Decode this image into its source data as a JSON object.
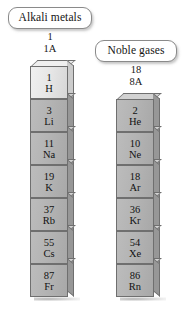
{
  "labels": {
    "alkali": "Alkali metals",
    "noble": "Noble gases"
  },
  "groups": {
    "left": {
      "number": "1",
      "roman": "1A"
    },
    "right": {
      "number": "18",
      "roman": "8A"
    }
  },
  "columns": [
    {
      "id": "alkali-metals-column",
      "label": "Alkali metals",
      "group_number": "1",
      "group_roman": "1A",
      "elements": [
        {
          "atomic_number": "1",
          "symbol": "H",
          "highlight": true
        },
        {
          "atomic_number": "3",
          "symbol": "Li",
          "highlight": false
        },
        {
          "atomic_number": "11",
          "symbol": "Na",
          "highlight": false
        },
        {
          "atomic_number": "19",
          "symbol": "K",
          "highlight": false
        },
        {
          "atomic_number": "37",
          "symbol": "Rb",
          "highlight": false
        },
        {
          "atomic_number": "55",
          "symbol": "Cs",
          "highlight": false
        },
        {
          "atomic_number": "87",
          "symbol": "Fr",
          "highlight": false
        }
      ]
    },
    {
      "id": "noble-gases-column",
      "label": "Noble gases",
      "group_number": "18",
      "group_roman": "8A",
      "elements": [
        {
          "atomic_number": "2",
          "symbol": "He",
          "highlight": false
        },
        {
          "atomic_number": "10",
          "symbol": "Ne",
          "highlight": false
        },
        {
          "atomic_number": "18",
          "symbol": "Ar",
          "highlight": false
        },
        {
          "atomic_number": "36",
          "symbol": "Kr",
          "highlight": false
        },
        {
          "atomic_number": "54",
          "symbol": "Xe",
          "highlight": false
        },
        {
          "atomic_number": "86",
          "symbol": "Rn",
          "highlight": false
        }
      ]
    }
  ],
  "colors": {
    "block_face": "#b4b4b4",
    "block_face_highlight": "#e6e6e6",
    "block_edge": "#6f6f6f",
    "background": "#ffffff",
    "text": "#111111",
    "callout_border": "#8a8a8a"
  }
}
